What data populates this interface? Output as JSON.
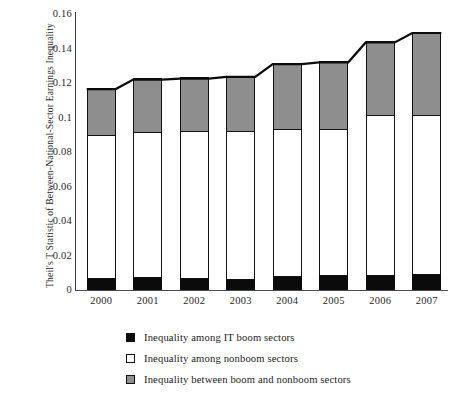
{
  "chart_data": {
    "type": "bar",
    "stacked": true,
    "title": "",
    "subtitle": "",
    "xlabel": "",
    "ylabel": "Theil's T Statistic of Between-National-Sector Earnings Inequality",
    "categories": [
      "2000",
      "2001",
      "2002",
      "2003",
      "2004",
      "2005",
      "2006",
      "2007"
    ],
    "ylim": [
      0,
      0.16
    ],
    "ytick_labels": [
      "0",
      "0.02",
      "0.04",
      "0.06",
      "0.08",
      "0.1",
      "0.12",
      "0.14",
      "0.16"
    ],
    "ytick_values": [
      0,
      0.02,
      0.04,
      0.06,
      0.08,
      0.1,
      0.12,
      0.14,
      0.16
    ],
    "grid": false,
    "legend_position": "bottom",
    "series": [
      {
        "name": "Inequality among IT boom sectors",
        "swatch": "sw-black",
        "color": "#0b0b0b",
        "values": [
          0.0065,
          0.0068,
          0.0062,
          0.006,
          0.0078,
          0.008,
          0.0082,
          0.0085
        ]
      },
      {
        "name": "Inequality among nonboom sectors",
        "swatch": "sw-white",
        "color": "#ffffff",
        "values": [
          0.0825,
          0.0842,
          0.0853,
          0.0855,
          0.0847,
          0.0845,
          0.0928,
          0.0925
        ]
      },
      {
        "name": "Inequality between boom and nonboom sectors",
        "swatch": "sw-gray",
        "color": "#8e8e8e",
        "values": [
          0.0275,
          0.031,
          0.031,
          0.032,
          0.0385,
          0.0395,
          0.0425,
          0.048
        ]
      }
    ],
    "totals": [
      0.1165,
      0.122,
      0.1225,
      0.1235,
      0.131,
      0.132,
      0.1435,
      0.149
    ],
    "connector_line": true
  },
  "legend": {
    "items": [
      {
        "label": "Inequality among IT boom sectors"
      },
      {
        "label": "Inequality among nonboom sectors"
      },
      {
        "label": "Inequality between boom and nonboom sectors"
      }
    ]
  }
}
